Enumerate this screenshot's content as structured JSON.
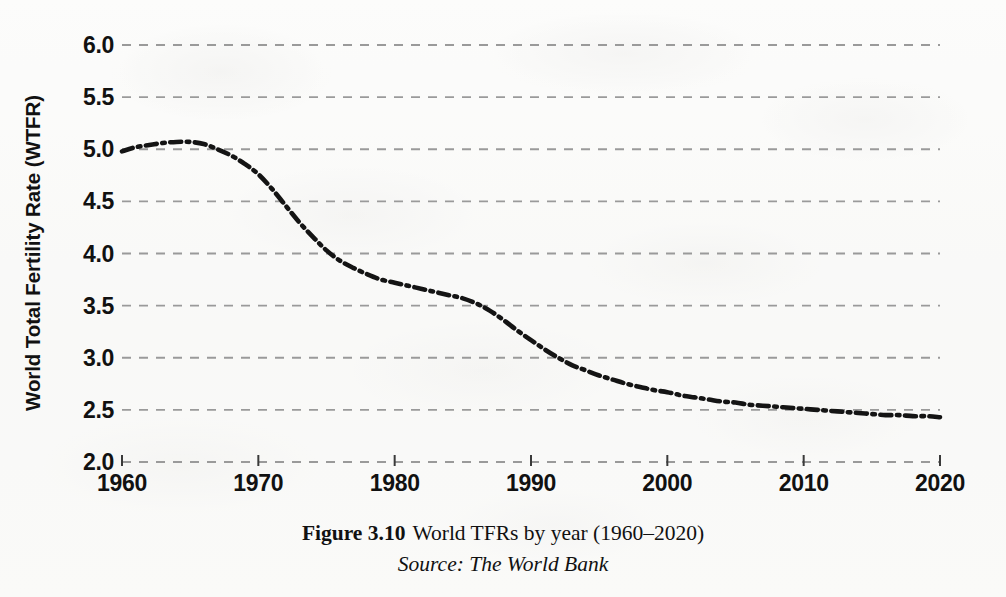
{
  "figure": {
    "number_label": "Figure 3.10",
    "caption": "World TFRs by year (1960–2020)",
    "source": "Source: The World Bank"
  },
  "chart_data": {
    "type": "line",
    "title": "",
    "xlabel": "",
    "ylabel": "World Total Fertility Rate (WTFR)",
    "xlim": [
      1960,
      2020
    ],
    "ylim": [
      2.0,
      6.0
    ],
    "grid": true,
    "legend": null,
    "line_style": "dash-dot",
    "line_color": "#141414",
    "gridline_color": "#9a9a9a",
    "x_ticks": [
      1960,
      1970,
      1980,
      1990,
      2000,
      2010,
      2020
    ],
    "x_tick_labels": [
      "1960",
      "1970",
      "1980",
      "1990",
      "2000",
      "2010",
      "2020"
    ],
    "y_ticks": [
      2.0,
      2.5,
      3.0,
      3.5,
      4.0,
      4.5,
      5.0,
      5.5,
      6.0
    ],
    "y_tick_labels": [
      "2.0",
      "2.5",
      "3.0",
      "3.5",
      "4.0",
      "4.5",
      "5.0",
      "5.5",
      "6.0"
    ],
    "series": [
      {
        "name": "World Total Fertility Rate",
        "x": [
          1960,
          1961,
          1962,
          1963,
          1964,
          1965,
          1966,
          1967,
          1968,
          1969,
          1970,
          1971,
          1972,
          1973,
          1974,
          1975,
          1976,
          1977,
          1978,
          1979,
          1980,
          1981,
          1982,
          1983,
          1984,
          1985,
          1986,
          1987,
          1988,
          1989,
          1990,
          1991,
          1992,
          1993,
          1994,
          1995,
          1996,
          1997,
          1998,
          1999,
          2000,
          2001,
          2002,
          2003,
          2004,
          2005,
          2006,
          2007,
          2008,
          2009,
          2010,
          2011,
          2012,
          2013,
          2014,
          2015,
          2016,
          2017,
          2018,
          2019,
          2020
        ],
        "values": [
          4.98,
          5.02,
          5.04,
          5.06,
          5.07,
          5.07,
          5.05,
          5.0,
          4.94,
          4.86,
          4.76,
          4.62,
          4.46,
          4.3,
          4.16,
          4.03,
          3.93,
          3.86,
          3.8,
          3.75,
          3.72,
          3.69,
          3.66,
          3.63,
          3.6,
          3.57,
          3.52,
          3.45,
          3.36,
          3.26,
          3.17,
          3.08,
          3.0,
          2.93,
          2.88,
          2.83,
          2.79,
          2.75,
          2.72,
          2.69,
          2.67,
          2.64,
          2.62,
          2.6,
          2.58,
          2.57,
          2.55,
          2.54,
          2.53,
          2.52,
          2.51,
          2.5,
          2.49,
          2.48,
          2.47,
          2.46,
          2.45,
          2.45,
          2.44,
          2.44,
          2.43
        ]
      }
    ]
  },
  "axis": {
    "y_title": "World Total Fertility Rate (WTFR)"
  }
}
